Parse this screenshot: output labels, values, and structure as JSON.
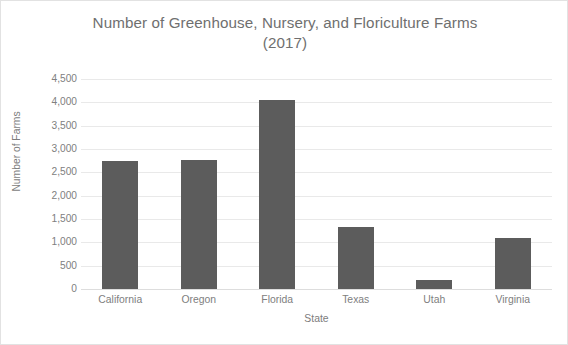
{
  "chart_data": {
    "type": "bar",
    "title": "Number of Greenhouse, Nursery, and Floriculture Farms (2017)",
    "title_lines": [
      "Number of Greenhouse, Nursery, and Floriculture Farms",
      "(2017)"
    ],
    "xlabel": "State",
    "ylabel": "Number of Farms",
    "categories": [
      "California",
      "Oregon",
      "Florida",
      "Texas",
      "Utah",
      "Virginia"
    ],
    "values": [
      2750,
      2770,
      4050,
      1330,
      200,
      1090
    ],
    "ylim": [
      0,
      4500
    ],
    "ytick_values": [
      0,
      500,
      1000,
      1500,
      2000,
      2500,
      3000,
      3500,
      4000,
      4500
    ],
    "ytick_labels": [
      "0",
      "500",
      "1,000",
      "1,500",
      "2,000",
      "2,500",
      "3,000",
      "3,500",
      "4,000",
      "4,500"
    ],
    "grid": true,
    "grid_axis": "y",
    "legend": false,
    "legend_position": "none",
    "bar_color": "#5c5c5c",
    "gridline_color": "#e9e9e9",
    "text_color": "#7d7d7d",
    "title_color": "#6f6f6f",
    "background_color": "#ffffff",
    "border_color": "#e2e2e2"
  }
}
